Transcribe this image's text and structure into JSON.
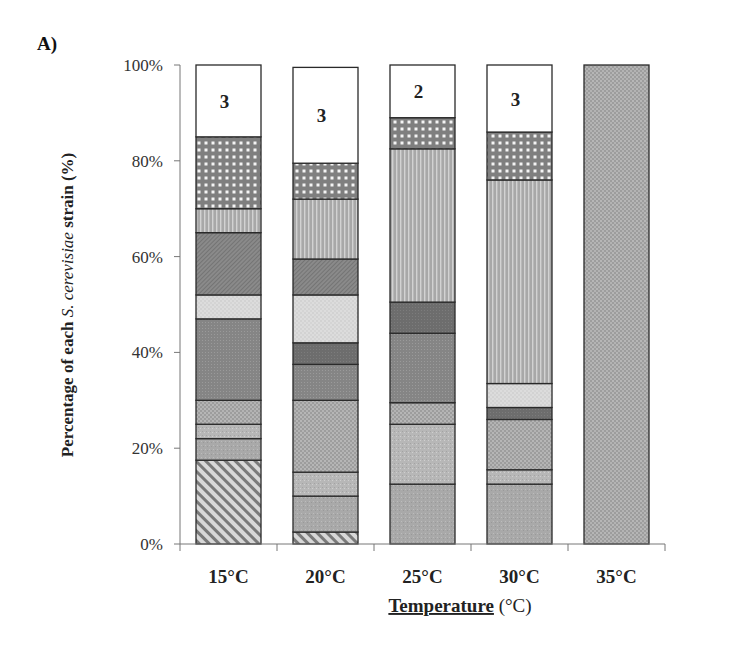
{
  "panel_label": "A)",
  "chart_data": {
    "type": "bar",
    "stacked": true,
    "title": "",
    "xlabel": "Temperature (°C)",
    "xlabel_main": "Temperature",
    "xlabel_unit": "(°C)",
    "ylabel": "Percentage of each S. cerevisiae strain (%)",
    "ylabel_parts": [
      "Percentage of each ",
      "S. cerevisiae",
      " strain (%)"
    ],
    "ylim": [
      0,
      100
    ],
    "yticks": [
      "0%",
      "20%",
      "40%",
      "60%",
      "80%",
      "100%"
    ],
    "categories": [
      "15°C",
      "20°C",
      "25°C",
      "30°C",
      "35°C"
    ],
    "legend": "none",
    "grid": false,
    "segment_order_bottom_to_top": [
      "hatched",
      "gray",
      "gray-light",
      "small-dots",
      "dark-dotted",
      "dark-solid",
      "light-dotted",
      "diagonal-dark",
      "vertical-stripes",
      "checkered",
      "white-other"
    ],
    "series": [
      {
        "name": "hatched",
        "pattern": "diagonal-hatch",
        "values": [
          17.5,
          2.5,
          0,
          0,
          0
        ]
      },
      {
        "name": "gray",
        "pattern": "gray-fill",
        "values": [
          4.5,
          7.5,
          12.5,
          12.5,
          0
        ]
      },
      {
        "name": "gray-light",
        "pattern": "gray-light-fill",
        "values": [
          3,
          5,
          12.5,
          3,
          0
        ]
      },
      {
        "name": "small-dots",
        "pattern": "small-dots",
        "values": [
          5,
          15,
          4.5,
          10.5,
          100
        ]
      },
      {
        "name": "dark-dotted",
        "pattern": "dark-dotted",
        "values": [
          17,
          7.5,
          14.5,
          0,
          0
        ]
      },
      {
        "name": "dark-solid",
        "pattern": "dark-solid",
        "values": [
          0,
          4.5,
          6.5,
          2.5,
          0
        ]
      },
      {
        "name": "light-dotted",
        "pattern": "light-dotted",
        "values": [
          5,
          10,
          0,
          5,
          0
        ]
      },
      {
        "name": "diagonal-dark",
        "pattern": "diagonal-dark",
        "values": [
          13,
          7.5,
          0,
          0,
          0
        ]
      },
      {
        "name": "vertical-stripes",
        "pattern": "vertical-stripes",
        "values": [
          5,
          12.5,
          32,
          42.5,
          0
        ]
      },
      {
        "name": "checkered",
        "pattern": "checkered",
        "values": [
          15,
          7.5,
          6.5,
          10,
          0
        ]
      },
      {
        "name": "white-other",
        "pattern": "white",
        "values": [
          15,
          20,
          11,
          14,
          0
        ]
      }
    ],
    "annotations": [
      {
        "category": "15°C",
        "text": "3"
      },
      {
        "category": "20°C",
        "text": "3"
      },
      {
        "category": "25°C",
        "text": "2"
      },
      {
        "category": "30°C",
        "text": "3"
      }
    ]
  }
}
